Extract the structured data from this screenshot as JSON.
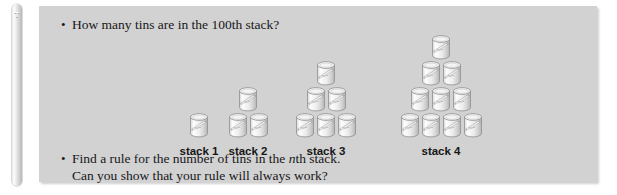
{
  "side_bar": {
    "glyph_label": "T",
    "icon": "text-tool-icon"
  },
  "panel": {
    "background_color": "#d2d2d2"
  },
  "questions": {
    "bullet_marker": "•",
    "top": "How many tins are in the 100th stack?",
    "bottom_line1_before_italic": "Find a rule for the number of tins in the ",
    "bottom_line1_italic": "n",
    "bottom_line1_after_italic": "th stack.",
    "bottom_line2": "Can you show that your rule will always work?"
  },
  "chart_data": {
    "type": "bar",
    "xlabel": "",
    "ylabel": "Number of tins",
    "categories": [
      "stack 1",
      "stack 2",
      "stack 3",
      "stack 4"
    ],
    "values": [
      1,
      3,
      6,
      10
    ],
    "rows_per_stack": [
      [
        1
      ],
      [
        2,
        1
      ],
      [
        3,
        2,
        1
      ],
      [
        4,
        3,
        2,
        1
      ]
    ]
  },
  "stacks": [
    {
      "id": "stack-1",
      "label": "stack 1",
      "tin_count": 1,
      "rows": [
        1
      ]
    },
    {
      "id": "stack-2",
      "label": "stack 2",
      "tin_count": 3,
      "rows": [
        2,
        1
      ]
    },
    {
      "id": "stack-3",
      "label": "stack 3",
      "tin_count": 6,
      "rows": [
        3,
        2,
        1
      ]
    },
    {
      "id": "stack-4",
      "label": "stack 4",
      "tin_count": 10,
      "rows": [
        4,
        3,
        2,
        1
      ]
    }
  ],
  "colors": {
    "panel": "#d2d2d2",
    "text": "#17171a",
    "tin_body_light": "#fbfbfb",
    "tin_body_shade": "#c6c6c6",
    "tin_outline": "#8f8f8f"
  }
}
